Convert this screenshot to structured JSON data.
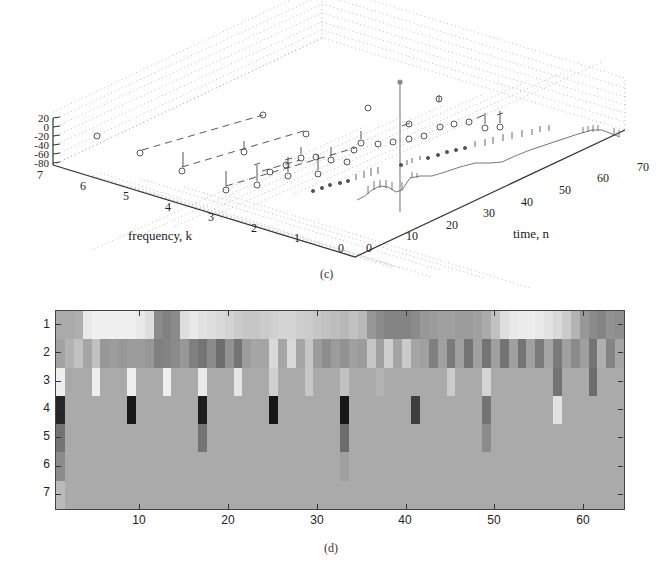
{
  "figure": {
    "panel_c_caption": "(c)",
    "panel_d_caption": "(d)"
  },
  "chart_data": [
    {
      "type": "scatter",
      "subtype": "3d-stem",
      "panel": "(c)",
      "title": "",
      "xlabel": "time, n",
      "ylabel": "frequency, k",
      "zlabel": "",
      "x_ticks": [
        "0",
        "10",
        "20",
        "30",
        "40",
        "50",
        "60",
        "70"
      ],
      "y_ticks": [
        "0",
        "1",
        "2",
        "3",
        "4",
        "5",
        "6",
        "7"
      ],
      "z_ticks": [
        "20",
        "0",
        "-20",
        "-40",
        "-60",
        "-80"
      ],
      "xlim": [
        0,
        70
      ],
      "ylim": [
        0,
        7
      ],
      "zlim": [
        -80,
        20
      ],
      "grid": true,
      "notes": "3D stem plot of magnitude (dB) vs time n and frequency k; tall spike near n=9,k=0; dense near-continuous sequences for k=0 and k=1, sparser circle markers with dashed connectors for k=2..6"
    },
    {
      "type": "heatmap",
      "panel": "(d)",
      "title": "",
      "xlabel": "",
      "ylabel": "",
      "x_ticks": [
        "10",
        "20",
        "30",
        "40",
        "50",
        "60"
      ],
      "y_ticks": [
        "1",
        "2",
        "3",
        "4",
        "5",
        "6",
        "7"
      ],
      "xlim": [
        0.5,
        64.5
      ],
      "ylim": [
        0.5,
        7.5
      ],
      "colormap": "gray (0=black, 1=white)",
      "default_value": 0.68,
      "rows": [
        {
          "row": 1,
          "cells": {
            "1": 0.68,
            "2": 0.68,
            "3": 0.7,
            "4": 0.95,
            "5": 0.98,
            "6": 0.98,
            "7": 0.98,
            "8": 0.98,
            "9": 0.98,
            "10": 0.95,
            "11": 0.9,
            "12": 0.55,
            "13": 0.5,
            "14": 0.55,
            "15": 0.9,
            "16": 0.95,
            "17": 0.92,
            "18": 0.9,
            "19": 0.88,
            "20": 0.85,
            "21": 0.82,
            "22": 0.8,
            "23": 0.8,
            "24": 0.82,
            "25": 0.84,
            "26": 0.86,
            "27": 0.86,
            "28": 0.84,
            "29": 0.82,
            "30": 0.8,
            "31": 0.78,
            "32": 0.76,
            "33": 0.74,
            "34": 0.78,
            "35": 0.74,
            "36": 0.6,
            "37": 0.55,
            "38": 0.52,
            "39": 0.52,
            "40": 0.52,
            "41": 0.55,
            "42": 0.6,
            "43": 0.62,
            "44": 0.64,
            "45": 0.64,
            "46": 0.62,
            "47": 0.62,
            "48": 0.64,
            "49": 0.68,
            "50": 0.78,
            "51": 0.9,
            "52": 0.95,
            "53": 0.96,
            "54": 0.96,
            "55": 0.95,
            "56": 0.92,
            "57": 0.88,
            "58": 0.82,
            "59": 0.72,
            "60": 0.6,
            "61": 0.55,
            "62": 0.52,
            "63": 0.58,
            "64": 0.56
          }
        },
        {
          "row": 2,
          "cells": {
            "1": 0.65,
            "2": 0.72,
            "3": 0.78,
            "4": 0.66,
            "5": 0.78,
            "6": 0.6,
            "7": 0.62,
            "8": 0.6,
            "9": 0.62,
            "10": 0.62,
            "11": 0.6,
            "12": 0.5,
            "13": 0.52,
            "14": 0.55,
            "15": 0.6,
            "16": 0.5,
            "17": 0.45,
            "18": 0.55,
            "19": 0.42,
            "20": 0.58,
            "21": 0.45,
            "22": 0.62,
            "23": 0.66,
            "24": 0.66,
            "25": 0.88,
            "26": 0.66,
            "27": 0.88,
            "28": 0.66,
            "29": 0.8,
            "30": 0.62,
            "31": 0.56,
            "32": 0.62,
            "33": 0.58,
            "34": 0.64,
            "35": 0.62,
            "36": 0.8,
            "37": 0.64,
            "38": 0.84,
            "39": 0.66,
            "40": 0.82,
            "41": 0.66,
            "42": 0.64,
            "43": 0.5,
            "44": 0.64,
            "45": 0.48,
            "46": 0.64,
            "47": 0.45,
            "48": 0.64,
            "49": 0.45,
            "50": 0.64,
            "51": 0.45,
            "52": 0.64,
            "53": 0.45,
            "54": 0.64,
            "55": 0.48,
            "56": 0.66,
            "57": 0.48,
            "58": 0.64,
            "59": 0.55,
            "60": 0.64,
            "61": 0.45,
            "62": 0.7,
            "63": 0.52,
            "64": 0.66
          }
        },
        {
          "row": 3,
          "cells": {
            "1": 0.97,
            "5": 0.97,
            "9": 0.97,
            "13": 0.97,
            "17": 0.95,
            "21": 0.93,
            "25": 0.84,
            "29": 0.8,
            "33": 0.78,
            "37": 0.72,
            "45": 0.82,
            "49": 0.86,
            "57": 0.45,
            "61": 0.42
          }
        },
        {
          "row": 4,
          "cells": {
            "1": 0.12,
            "9": 0.06,
            "17": 0.08,
            "25": 0.05,
            "33": 0.05,
            "41": 0.22,
            "49": 0.45,
            "57": 0.92
          }
        },
        {
          "row": 5,
          "cells": {
            "1": 0.45,
            "17": 0.45,
            "33": 0.42,
            "49": 0.55
          }
        },
        {
          "row": 6,
          "cells": {
            "1": 0.55,
            "33": 0.64
          }
        },
        {
          "row": 7,
          "cells": {
            "1": 0.75
          }
        }
      ]
    }
  ]
}
